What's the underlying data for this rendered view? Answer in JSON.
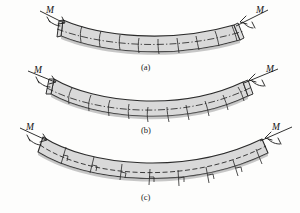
{
  "figure": {
    "background_color": "#fdfdfc",
    "beam_fill_color": "#d9d9d9",
    "line_color": "#2b2b2b"
  },
  "panels": [
    {
      "id": "a",
      "caption": "(a)",
      "caption_x": 146,
      "caption_y": 70,
      "description": "Undeformed-grid beam bent by end couples; longitudinal neutral axis shown as dash-dot line",
      "left_moment_label": "M",
      "right_moment_label": "M",
      "left_label_x": 48,
      "left_label_y": 14,
      "right_label_x": 258,
      "right_label_y": 14,
      "neutral_axis_style": "dash-dot",
      "grid_count": 9,
      "has_right_angle_marks": false
    },
    {
      "id": "b",
      "caption": "(b)",
      "caption_x": 146,
      "caption_y": 133,
      "description": "Deformed beam showing transverse lines remaining straight and rotating",
      "left_moment_label": "M",
      "right_moment_label": "M",
      "left_label_x": 35,
      "left_label_y": 74,
      "right_label_x": 270,
      "right_label_y": 74,
      "neutral_axis_style": "dash-dot",
      "grid_count": 10,
      "has_right_angle_marks": false
    },
    {
      "id": "c",
      "caption": "(c)",
      "caption_x": 146,
      "caption_y": 200,
      "description": "Cross sections remain plane and perpendicular to the longitudinal neutral axis; right-angle marks indicate perpendicularity",
      "left_moment_label": "M",
      "right_moment_label": "M",
      "left_label_x": 30,
      "left_label_y": 131,
      "right_label_x": 272,
      "right_label_y": 131,
      "neutral_axis_style": "dashed",
      "grid_count": 8,
      "has_right_angle_marks": true
    }
  ],
  "captions": {
    "a": "(a)",
    "b": "(b)",
    "c": "(c)"
  },
  "moment_labels": {
    "a_left": "M",
    "a_right": "M",
    "b_left": "M",
    "b_right": "M",
    "c_left": "M",
    "c_right": "M"
  }
}
